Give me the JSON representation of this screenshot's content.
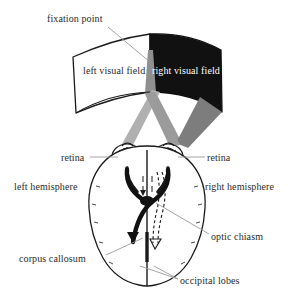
{
  "figure": {
    "background_color": "#ffffff",
    "ink_color": "#1a1a1a",
    "leader_line_color": "#9a9a9a",
    "field_fill_left": "#ffffff",
    "field_fill_right": "#111111",
    "cone_fill_light": "#b0b0b0",
    "cone_fill_mid": "#8f8f8f",
    "cone_fill_dark": "#7d7d7d"
  },
  "labels": {
    "fixation_point": "fixation point",
    "left_visual_field": "left visual field",
    "right_visual_field": "right visual field",
    "retina_left": "retina",
    "retina_right": "retina",
    "left_hemisphere": "left hemisphere",
    "right_hemisphere": "right hemisphere",
    "optic_chiasm": "optic chiasm",
    "corpus_callosum": "corpus callosum",
    "occipital_lobes": "occipital lobes"
  },
  "structures": [
    {
      "name": "visual-field-band-left",
      "fill": "#ffffff",
      "stroke": "#1a1a1a"
    },
    {
      "name": "visual-field-band-right",
      "fill": "#111111",
      "stroke": "#111111"
    },
    {
      "name": "fixation-cone",
      "fill": "#8f8f8f"
    },
    {
      "name": "left-visual-field-cone",
      "fill": "#b0b0b0"
    },
    {
      "name": "right-visual-field-cone",
      "fill": "#7d7d7d"
    },
    {
      "name": "eye-left",
      "fill": "#ffffff",
      "stroke": "#1a1a1a"
    },
    {
      "name": "eye-right",
      "fill": "#ffffff",
      "stroke": "#1a1a1a"
    },
    {
      "name": "brain-outline",
      "fill": "#ffffff",
      "stroke": "#1a1a1a"
    },
    {
      "name": "optic-tract-crossed-solid",
      "stroke": "#111111"
    },
    {
      "name": "optic-tract-uncrossed-dashed",
      "stroke": "#1a1a1a"
    },
    {
      "name": "corpus-callosum-midline",
      "stroke": "#1a1a1a"
    }
  ]
}
